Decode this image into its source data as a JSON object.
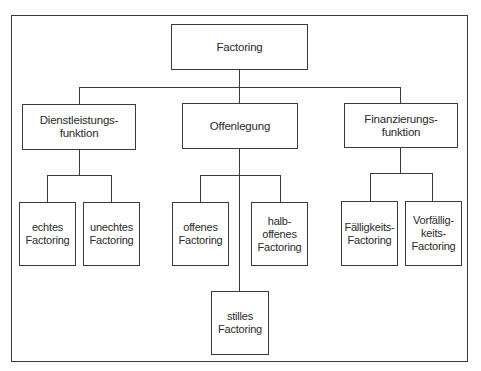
{
  "diagram": {
    "type": "tree",
    "root": {
      "label": "Factoring"
    },
    "categories": [
      {
        "label": "Dienstleistungs-\nfunktion",
        "children": [
          {
            "label": "echtes\nFactoring"
          },
          {
            "label": "unechtes\nFactoring"
          }
        ]
      },
      {
        "label": "Offenlegung",
        "children": [
          {
            "label": "offenes\nFactoring"
          },
          {
            "label": "halb-\noffenes\nFactoring"
          },
          {
            "label": "stilles\nFactoring"
          }
        ]
      },
      {
        "label": "Finanzierungs-\nfunktion",
        "children": [
          {
            "label": "Fälligkeits-\nFactoring"
          },
          {
            "label": "Vorfällig-\nkeits-\nFactoring"
          }
        ]
      }
    ],
    "colors": {
      "line": "#3a3a3a",
      "background": "#ffffff",
      "text": "#2a2a2a"
    }
  }
}
